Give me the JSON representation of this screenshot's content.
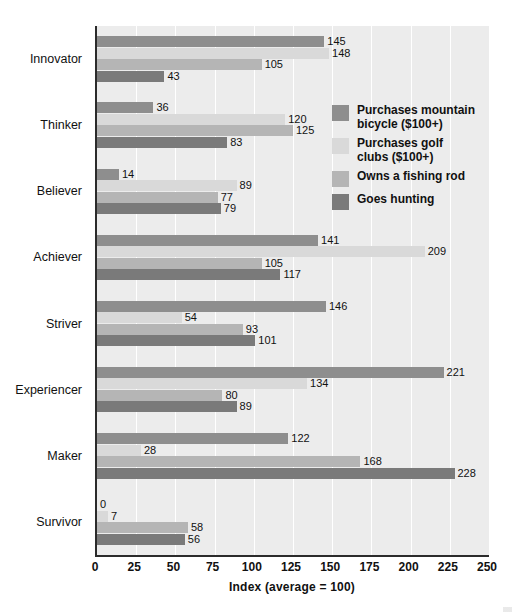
{
  "chart_data": {
    "type": "bar",
    "orientation": "horizontal",
    "title": "",
    "xlabel": "Index (average = 100)",
    "ylabel": "",
    "xlim": [
      0,
      250
    ],
    "xticks": [
      0,
      25,
      50,
      75,
      100,
      125,
      150,
      175,
      200,
      225,
      250
    ],
    "grid": true,
    "legend_position": "inside-upper-right",
    "categories": [
      "Innovator",
      "Thinker",
      "Believer",
      "Achiever",
      "Striver",
      "Experiencer",
      "Maker",
      "Survivor"
    ],
    "series": [
      {
        "name": "Purchases mountain bicycle ($100+)",
        "color": "#8e8e8e",
        "values": [
          145,
          36,
          14,
          141,
          146,
          221,
          122,
          0
        ]
      },
      {
        "name": "Purchases golf clubs ($100+)",
        "color": "#d9d9d9",
        "values": [
          148,
          120,
          89,
          209,
          54,
          134,
          28,
          7
        ]
      },
      {
        "name": "Owns a fishing rod",
        "color": "#b5b5b5",
        "values": [
          105,
          125,
          77,
          105,
          93,
          80,
          168,
          58
        ]
      },
      {
        "name": "Goes hunting",
        "color": "#7a7a7a",
        "values": [
          43,
          83,
          79,
          117,
          101,
          89,
          228,
          56
        ]
      }
    ]
  },
  "legend": {
    "items": [
      {
        "label": "Purchases mountain\nbicycle ($100+)",
        "color": "#8e8e8e",
        "swatch_name": "legend-swatch-mountain-bicycle"
      },
      {
        "label": "Purchases golf\nclubs ($100+)",
        "color": "#d9d9d9",
        "swatch_name": "legend-swatch-golf-clubs"
      },
      {
        "label": "Owns a fishing rod",
        "color": "#b5b5b5",
        "swatch_name": "legend-swatch-fishing-rod"
      },
      {
        "label": "Goes hunting",
        "color": "#7a7a7a",
        "swatch_name": "legend-swatch-goes-hunting"
      }
    ]
  },
  "style": {
    "plot_background": "#ececec",
    "gridline_color": "#ffffff",
    "axis_color": "#2b2b2b",
    "text_color": "#111111",
    "page_background": "#ffffff"
  }
}
